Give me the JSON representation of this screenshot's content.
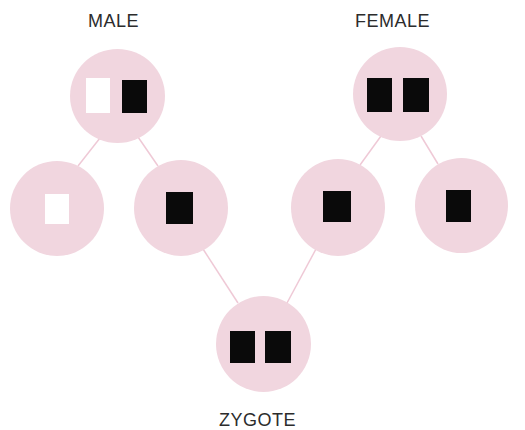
{
  "diagram": {
    "labels": {
      "male": "MALE",
      "female": "FEMALE",
      "zygote": "ZYGOTE"
    },
    "colors": {
      "cell_fill": "#f1d6df",
      "connector": "#efc9d6",
      "chromosome_dark": "#0a0a0a",
      "chromosome_light": "#ffffff",
      "label_text": "#2c2c2c"
    },
    "nodes": [
      {
        "id": "male-parent",
        "role": "parent",
        "label": "MALE",
        "chromosomes": [
          "white",
          "black"
        ]
      },
      {
        "id": "male-gamete-1",
        "role": "gamete",
        "chromosomes": [
          "white"
        ]
      },
      {
        "id": "male-gamete-2",
        "role": "gamete",
        "chromosomes": [
          "black"
        ]
      },
      {
        "id": "female-gamete-1",
        "role": "gamete",
        "chromosomes": [
          "black"
        ]
      },
      {
        "id": "female-gamete-2",
        "role": "gamete",
        "chromosomes": [
          "black"
        ]
      },
      {
        "id": "female-parent",
        "role": "parent",
        "label": "FEMALE",
        "chromosomes": [
          "black",
          "black"
        ]
      },
      {
        "id": "zygote",
        "role": "offspring",
        "label": "ZYGOTE",
        "chromosomes": [
          "black",
          "black"
        ]
      }
    ],
    "edges": [
      {
        "from": "male-parent",
        "to": "male-gamete-1"
      },
      {
        "from": "male-parent",
        "to": "male-gamete-2"
      },
      {
        "from": "female-parent",
        "to": "female-gamete-1"
      },
      {
        "from": "female-parent",
        "to": "female-gamete-2"
      },
      {
        "from": "male-gamete-2",
        "to": "zygote"
      },
      {
        "from": "female-gamete-1",
        "to": "zygote"
      }
    ]
  }
}
